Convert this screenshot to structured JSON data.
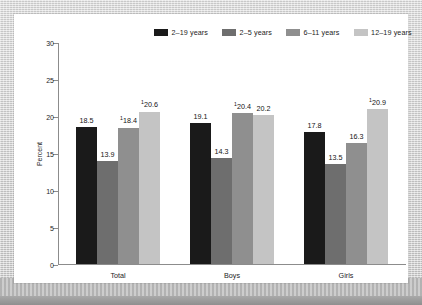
{
  "chart_data": {
    "type": "bar",
    "title": "",
    "xlabel": "",
    "ylabel": "Percent",
    "ylim": [
      0,
      30
    ],
    "yticks": [
      0,
      5,
      10,
      15,
      20,
      25,
      30
    ],
    "ytick_labels": [
      "0",
      "5",
      "10",
      "15",
      "20",
      "25",
      "30"
    ],
    "grid": false,
    "legend_position": "top-right",
    "categories": [
      "Total",
      "Boys",
      "Girls"
    ],
    "series": [
      {
        "name": "2–19 years",
        "color": "#1a1a1a",
        "values": [
          18.5,
          19.1,
          17.8
        ],
        "labels": [
          "18.5",
          "19.1",
          "17.8"
        ],
        "footnote_markers": [
          "",
          "",
          ""
        ]
      },
      {
        "name": "2–5 years",
        "color": "#6e6e6e",
        "values": [
          13.9,
          14.3,
          13.5
        ],
        "labels": [
          "13.9",
          "14.3",
          "13.5"
        ],
        "footnote_markers": [
          "",
          "",
          ""
        ]
      },
      {
        "name": "6–11 years",
        "color": "#8f8f8f",
        "values": [
          18.4,
          20.4,
          16.3
        ],
        "labels": [
          "18.4",
          "20.4",
          "16.3"
        ],
        "footnote_markers": [
          "1",
          "1",
          ""
        ]
      },
      {
        "name": "12–19 years",
        "color": "#c4c4c4",
        "values": [
          20.6,
          20.2,
          20.9
        ],
        "labels": [
          "20.6",
          "20.2",
          "20.9"
        ],
        "footnote_markers": [
          "1",
          "",
          "1"
        ]
      }
    ]
  },
  "colors": {
    "axis": "#8c8c8c",
    "text": "#1d1d1d",
    "panel_background": "#ffffff",
    "page_background": "#cfcfcf"
  }
}
